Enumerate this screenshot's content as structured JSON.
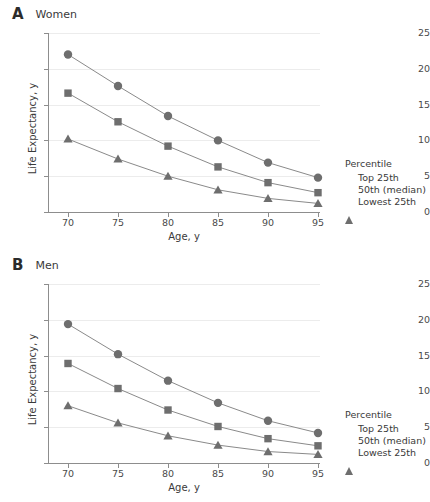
{
  "figure": {
    "panels": [
      {
        "letter": "A",
        "title": "Women",
        "axis_title_x": "Age, y",
        "axis_title_y": "Life Expectancy, y",
        "y_ticks": [
          "0",
          "5",
          "10",
          "15",
          "20",
          "25"
        ],
        "x_ticks": [
          "70",
          "75",
          "80",
          "85",
          "90",
          "95"
        ],
        "legend_title": "Percentile",
        "legend_items": [
          "Top 25th",
          "50th (median)",
          "Lowest 25th"
        ]
      },
      {
        "letter": "B",
        "title": "Men",
        "axis_title_x": "Age, y",
        "axis_title_y": "Life Expectancy, y",
        "y_ticks": [
          "0",
          "5",
          "10",
          "15",
          "20",
          "25"
        ],
        "x_ticks": [
          "70",
          "75",
          "80",
          "85",
          "90",
          "95"
        ],
        "legend_title": "Percentile",
        "legend_items": [
          "Top 25th",
          "50th (median)",
          "Lowest 25th"
        ]
      }
    ],
    "colors": {
      "marker": "#6e6e6e",
      "line": "#8a8a8a",
      "axis": "#8d8d8d",
      "grid": "#ececec",
      "text": "#3a3a3a"
    }
  },
  "chart_data": [
    {
      "type": "line",
      "panel": "A",
      "title": "Women",
      "xlabel": "Age, y",
      "ylabel": "Life Expectancy, y",
      "x": [
        70,
        75,
        80,
        85,
        90,
        95
      ],
      "xlim": [
        70,
        95
      ],
      "ylim": [
        0,
        25
      ],
      "grid": true,
      "legend_title": "Percentile",
      "legend_position": "right",
      "series": [
        {
          "name": "Top 25th",
          "marker": "circle",
          "values": [
            22.0,
            17.6,
            13.4,
            10.0,
            6.9,
            4.8
          ]
        },
        {
          "name": "50th (median)",
          "marker": "square",
          "values": [
            16.6,
            12.6,
            9.2,
            6.3,
            4.1,
            2.7
          ]
        },
        {
          "name": "Lowest 25th",
          "marker": "triangle",
          "values": [
            10.2,
            7.4,
            5.0,
            3.1,
            1.9,
            1.2
          ]
        }
      ]
    },
    {
      "type": "line",
      "panel": "B",
      "title": "Men",
      "xlabel": "Age, y",
      "ylabel": "Life Expectancy, y",
      "x": [
        70,
        75,
        80,
        85,
        90,
        95
      ],
      "xlim": [
        70,
        95
      ],
      "ylim": [
        0,
        25
      ],
      "grid": true,
      "legend_title": "Percentile",
      "legend_position": "right",
      "series": [
        {
          "name": "Top 25th",
          "marker": "circle",
          "values": [
            19.4,
            15.2,
            11.5,
            8.4,
            5.9,
            4.2
          ]
        },
        {
          "name": "50th (median)",
          "marker": "square",
          "values": [
            13.9,
            10.4,
            7.4,
            5.1,
            3.4,
            2.4
          ]
        },
        {
          "name": "Lowest 25th",
          "marker": "triangle",
          "values": [
            8.0,
            5.6,
            3.8,
            2.5,
            1.6,
            1.2
          ]
        }
      ]
    }
  ]
}
